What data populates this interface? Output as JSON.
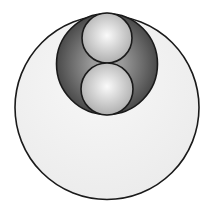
{
  "diagram": {
    "background": "#ffffff",
    "stroke": "#1a1a1a",
    "outer_circle": {
      "cx": 107,
      "cy": 107.5,
      "r": 92,
      "fill_center": "#f7f7f7",
      "fill_edge": "#ebebeb"
    },
    "middle_circle": {
      "cx": 107,
      "cy": 64,
      "r": 50.5,
      "fill_center": "#9a9a9a",
      "fill_edge": "#4a4a4a"
    },
    "inner_circles": [
      {
        "cx": 107,
        "cy": 38,
        "r": 25,
        "fill_center": "#fafafa",
        "fill_edge": "#a8a8a8"
      },
      {
        "cx": 107,
        "cy": 89,
        "r": 26,
        "fill_center": "#fafafa",
        "fill_edge": "#a8a8a8"
      }
    ]
  }
}
